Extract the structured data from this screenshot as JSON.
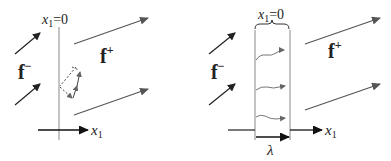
{
  "left_panel": {
    "boundary_label": {
      "var": "x",
      "sub": "1",
      "rest": "=0"
    },
    "incoming_label": {
      "base": "f",
      "sup": "−"
    },
    "outgoing_label": {
      "base": "f",
      "sup": "+"
    },
    "axis_label": {
      "var": "x",
      "sub": "1"
    }
  },
  "right_panel": {
    "boundary_label": {
      "var": "x",
      "sub": "1",
      "rest": "=0"
    },
    "incoming_label": {
      "base": "f",
      "sup": "−"
    },
    "outgoing_label": {
      "base": "f",
      "sup": "+"
    },
    "axis_label": {
      "var": "x",
      "sub": "1"
    },
    "width_label": "λ"
  },
  "colors": {
    "arrow_dark": "#222222",
    "arrow_gray": "#555555",
    "line_gray": "#888888",
    "wavy_gray": "#777777"
  }
}
